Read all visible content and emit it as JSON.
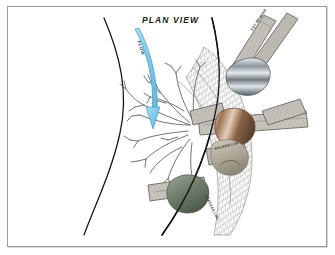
{
  "figure": {
    "title": "PLAN  VIEW",
    "view_type": "plan",
    "background_color": "#ffffff",
    "frame_color": "#9a9a9a"
  },
  "annotations": {
    "flow_arrow_label": "FLOW",
    "flow_arrow_color": "#7ec8e8",
    "flow_arrow_outline": "#3d8fb5"
  },
  "channel": {
    "left_bank_label": "left bank line",
    "right_bank_label": "right bank line",
    "bank_line_color": "#111111"
  },
  "elements": {
    "rootwad_label": "root wad",
    "log_labels": [
      "KEY MEMBER",
      "RACKED LOG",
      "STACKED LOG"
    ],
    "boulders": [
      {
        "name": "ballast-boulder-upper",
        "color": "#8e979c"
      },
      {
        "name": "ballast-boulder-center",
        "color": "#9a7054"
      },
      {
        "name": "ballast-boulder-lower",
        "color": "#7e8a7c"
      },
      {
        "name": "ballast-boulder-mid",
        "color": "#b9b2a3"
      }
    ],
    "log_fill": "#d9d7cf",
    "log_stroke": "#4a4a48",
    "rootwad_stroke": "#5a5a58"
  }
}
